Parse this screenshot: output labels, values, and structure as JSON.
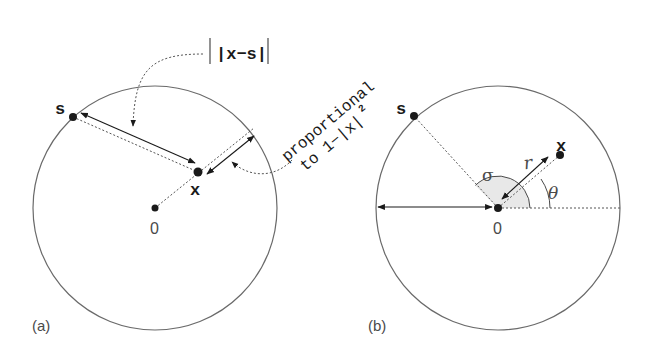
{
  "colors": {
    "circle_stroke": "#6a6a6a",
    "ink": "#1a1a1a",
    "dotted": "#555555",
    "label_gray": "#4a4a4a",
    "sector_fill": "#e8e8e8"
  },
  "panel_a": {
    "label": "(a)",
    "point_s": "s",
    "point_x": "x",
    "origin": "0",
    "distance_label": "|x−s|",
    "annotation_line1": "proportional",
    "annotation_line2": "to 1−|x|",
    "annotation_exponent": "2"
  },
  "panel_b": {
    "label": "(b)",
    "point_s": "s",
    "point_x": "x",
    "origin": "0",
    "radius_label": "r",
    "sigma_label": "σ",
    "theta_label": "θ"
  }
}
